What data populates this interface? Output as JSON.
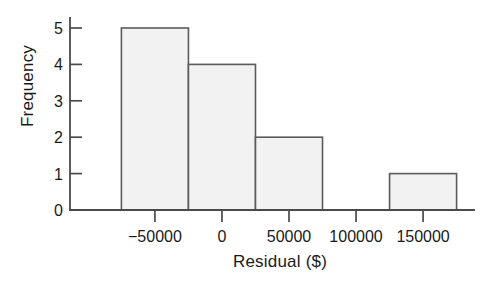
{
  "chart_data": {
    "type": "bar",
    "subtype": "histogram",
    "title": "",
    "xlabel": "Residual ($)",
    "ylabel": "Frequency",
    "xlim": [
      -85000,
      185000
    ],
    "ylim": [
      0,
      5
    ],
    "grid": false,
    "legend": null,
    "bin_width": 50000,
    "categories": [
      "-75000 to -25000",
      "-25000 to 25000",
      "25000 to 75000",
      "75000 to 125000",
      "125000 to 175000"
    ],
    "bin_edges": [
      -75000,
      -25000,
      25000,
      75000,
      125000,
      175000
    ],
    "values": [
      5,
      4,
      2,
      0,
      1
    ],
    "bars": [
      {
        "left": -75000,
        "right": -25000,
        "value": 5
      },
      {
        "left": -25000,
        "right": 25000,
        "value": 4
      },
      {
        "left": 25000,
        "right": 75000,
        "value": 2
      },
      {
        "left": 75000,
        "right": 125000,
        "value": 0
      },
      {
        "left": 125000,
        "right": 175000,
        "value": 1
      }
    ],
    "xticks": [
      -50000,
      0,
      50000,
      100000,
      150000
    ],
    "xticklabels": [
      "−50000",
      "0",
      "50000",
      "100000",
      "150000"
    ],
    "yticks": [
      0,
      1,
      2,
      3,
      4,
      5
    ],
    "yticklabels": [
      "0",
      "1",
      "2",
      "3",
      "4",
      "5"
    ],
    "colors": {
      "bar_fill": "#f2f2f2",
      "bar_edge": "#5b5b5b",
      "axis": "#4a4a4a",
      "text": "#1a1a1a",
      "background": "#ffffff"
    }
  }
}
